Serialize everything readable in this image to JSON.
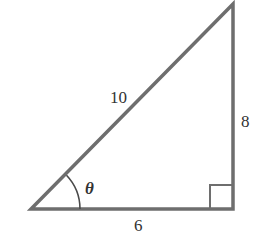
{
  "diagram": {
    "type": "right-triangle",
    "stroke_color": "#6e6e6e",
    "text_color": "#333333",
    "labels": {
      "hypotenuse": "10",
      "opposite": "8",
      "adjacent": "6",
      "angle": "θ"
    },
    "right_angle_marker": true
  }
}
